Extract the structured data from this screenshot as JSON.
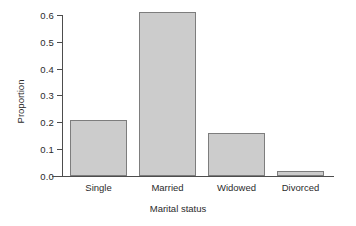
{
  "chart_data": {
    "type": "bar",
    "title": "",
    "xlabel": "Marital status",
    "ylabel": "Proportion",
    "categories": [
      "Single",
      "Married",
      "Widowed",
      "Divorced"
    ],
    "values": [
      0.21,
      0.61,
      0.16,
      0.02
    ],
    "ylim": [
      0.0,
      0.6
    ],
    "ytick_labels": [
      "0.0",
      "0.1",
      "0.2",
      "0.3",
      "0.4",
      "0.5",
      "0.6"
    ],
    "ytick_values": [
      0.0,
      0.1,
      0.2,
      0.3,
      0.4,
      0.5,
      0.6
    ],
    "grid": false,
    "legend": false,
    "bar_fill_color": "#cccccc",
    "bar_border_color": "#7d7d7d",
    "axis_color": "#4d4d4d",
    "text_color": "#2b2b2b",
    "background_color": "#ffffff"
  }
}
